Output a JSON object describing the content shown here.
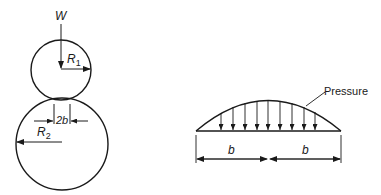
{
  "figure": {
    "left": {
      "load_label": "W",
      "small_radius_label": "R",
      "small_radius_sub": "1",
      "large_radius_label": "R",
      "large_radius_sub": "2",
      "contact_width_label": "2b"
    },
    "right": {
      "pressure_label": "Pressure",
      "half_width_left_label": "b",
      "half_width_right_label": "b",
      "pressure_arrow_count": 9
    },
    "colors": {
      "stroke": "#1a1a1a",
      "background": "#ffffff"
    }
  }
}
